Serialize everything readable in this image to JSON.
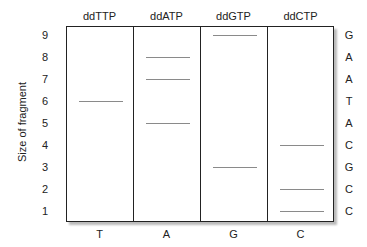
{
  "diagram": {
    "ylabel": "Size of fragment",
    "lanes": [
      {
        "header": "ddTTP",
        "footer": "T"
      },
      {
        "header": "ddATP",
        "footer": "A"
      },
      {
        "header": "ddGTP",
        "footer": "G"
      },
      {
        "header": "ddCTP",
        "footer": "C"
      }
    ],
    "sizes": [
      "9",
      "8",
      "7",
      "6",
      "5",
      "4",
      "3",
      "2",
      "1"
    ],
    "sequence": [
      "G",
      "A",
      "A",
      "T",
      "A",
      "C",
      "G",
      "C",
      "C"
    ],
    "bands": [
      {
        "lane": 0,
        "size": 6
      },
      {
        "lane": 1,
        "size": 8
      },
      {
        "lane": 1,
        "size": 7
      },
      {
        "lane": 1,
        "size": 5
      },
      {
        "lane": 2,
        "size": 9
      },
      {
        "lane": 2,
        "size": 3
      },
      {
        "lane": 3,
        "size": 4
      },
      {
        "lane": 3,
        "size": 2
      },
      {
        "lane": 3,
        "size": 1
      }
    ],
    "colors": {
      "border": "#222222",
      "band": "#8a8a8a",
      "shadow": "#bbbbbb"
    }
  }
}
